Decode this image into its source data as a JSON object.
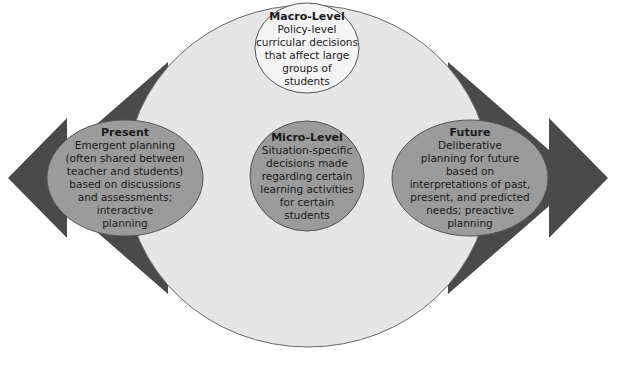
{
  "diagram": {
    "colors": {
      "arrow": "#4a4a4a",
      "big_ellipse": "#e6e6e6",
      "macro_fill": "#f4f4f4",
      "level_fill": "#9b9b9b",
      "outline": "#555555"
    },
    "macro": {
      "title": "Macro-Level",
      "body": "Policy-level\ncurricular decisions\nthat affect large\ngroups of\nstudents"
    },
    "micro": {
      "title": "Micro-Level",
      "body": "Situation-specific\ndecisions made\nregarding certain\nlearning activities\nfor certain\nstudents"
    },
    "present": {
      "title": "Present",
      "body": "Emergent planning\n(often shared between\nteacher and students)\nbased on discussions\nand assessments;\ninteractive\nplanning",
      "arrow_direction": "left"
    },
    "future": {
      "title": "Future",
      "body": "Deliberative\nplanning for future\nbased on\ninterpretations of past,\npresent, and predicted\nneeds; preactive\nplanning",
      "arrow_direction": "right"
    }
  }
}
